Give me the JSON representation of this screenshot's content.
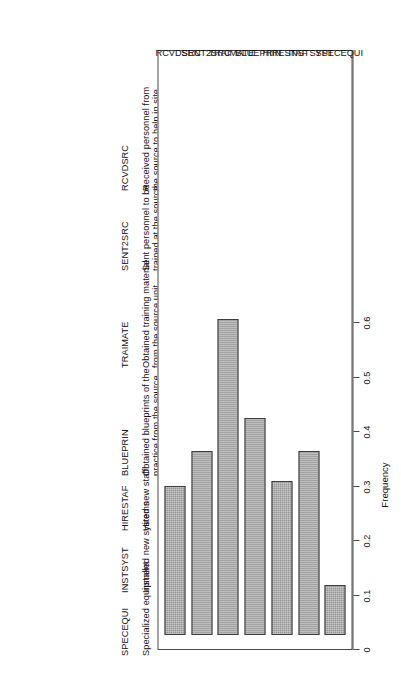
{
  "figure": {
    "orientation": "rotated-90",
    "bar_fill_color": "#949494",
    "bar_border_color": "#3d3d3d",
    "axis_color": "#4a4a4a"
  },
  "chart_data": {
    "type": "bar",
    "title": "",
    "xlabel": "",
    "ylabel": "Frequency",
    "ylim": [
      0,
      0.6
    ],
    "grid": false,
    "legend_position": "top",
    "categories": [
      "SPECEQUI",
      "INSTSYST",
      "HIRESTAF",
      "BLUEPRIN",
      "TRAIMATE",
      "SENT2SRC",
      "RCVDSRC"
    ],
    "values": [
      0.09,
      0.335,
      0.28,
      0.395,
      0.575,
      0.335,
      0.27
    ],
    "tick_labels": [
      "0",
      "0.1",
      "0.2",
      "0.3",
      "0.4",
      "0.5",
      "0.6"
    ],
    "tick_values": [
      0,
      0.1,
      0.2,
      0.3,
      0.4,
      0.5,
      0.6
    ],
    "series": [
      {
        "name": "Frequency",
        "points": [
          {
            "category": "SPECEQUI",
            "value": 0.09
          },
          {
            "category": "INSTSYST",
            "value": 0.335
          },
          {
            "category": "HIRESTAF",
            "value": 0.28
          },
          {
            "category": "BLUEPRIN",
            "value": 0.395
          },
          {
            "category": "TRAIMATE",
            "value": 0.575
          },
          {
            "category": "SENT2SRC",
            "value": 0.335
          },
          {
            "category": "RCVDSRC",
            "value": 0.27
          }
        ]
      }
    ]
  },
  "legend": {
    "entries": [
      {
        "code": "SPECEQUI",
        "desc": "Specialized equipment"
      },
      {
        "code": "INSTSYST",
        "desc": "Installed new systems"
      },
      {
        "code": "HIRESTAF",
        "desc": "Hired new staff"
      },
      {
        "code": "BLUEPRIN",
        "desc": "Obtained blueprints of the\npractice from the source\nunit"
      },
      {
        "code": "TRAIMATE",
        "desc": "Obtained training material\nfrom the source unit"
      },
      {
        "code": "SENT2SRC",
        "desc": "Sent personnel to be\ntrained at the source"
      },
      {
        "code": "RCVDSRC",
        "desc": "Received personnel from\nthe source to help in site"
      }
    ]
  }
}
